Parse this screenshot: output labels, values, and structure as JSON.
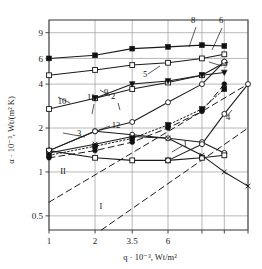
{
  "chart_data": {
    "type": "line",
    "title": "",
    "xlabel": "q · 10⁻³, Wt/m²",
    "ylabel": "α · 10⁻³, Wt/(m² K)",
    "xscale": "log",
    "yscale": "log",
    "xlim": [
      1,
      20
    ],
    "ylim": [
      0.4,
      11
    ],
    "grid": true,
    "legend_position": "inline-callouts",
    "xticks": [
      {
        "value": 1,
        "label": "1"
      },
      {
        "value": 2,
        "label": "2"
      },
      {
        "value": 3.5,
        "label": "3.5"
      },
      {
        "value": 6,
        "label": "6"
      },
      {
        "value": 10,
        "label": ""
      },
      {
        "value": 14,
        "label": ""
      },
      {
        "value": 20,
        "label": ""
      }
    ],
    "yticks": [
      {
        "value": 9,
        "label": "9"
      },
      {
        "value": 6,
        "label": "6"
      },
      {
        "value": 4,
        "label": "4"
      },
      {
        "value": 2,
        "label": "2"
      },
      {
        "value": 1,
        "label": "1"
      },
      {
        "value": 0.5,
        "label": "0.5"
      }
    ],
    "annotations": [
      {
        "text": "1",
        "x": 185,
        "y": 147
      },
      {
        "text": "2",
        "x": 113,
        "y": 99
      },
      {
        "text": "3",
        "x": 79,
        "y": 136
      },
      {
        "text": "4",
        "x": 228,
        "y": 120
      },
      {
        "text": "5",
        "x": 145,
        "y": 77
      },
      {
        "text": "6",
        "x": 221,
        "y": 23
      },
      {
        "text": "7",
        "x": 226,
        "y": 68
      },
      {
        "text": "8",
        "x": 193,
        "y": 23
      },
      {
        "text": "9",
        "x": 106,
        "y": 95
      },
      {
        "text": "10",
        "x": 62,
        "y": 104
      },
      {
        "text": "11",
        "x": 91,
        "y": 100
      },
      {
        "text": "12",
        "x": 116,
        "y": 128
      },
      {
        "text": "I",
        "x": 101,
        "y": 209
      },
      {
        "text": "II",
        "x": 63,
        "y": 174
      }
    ],
    "series": [
      {
        "name": "8",
        "marker": "filled-square",
        "style": "solid",
        "points": [
          [
            1.0,
            6.0
          ],
          [
            2.0,
            6.3
          ],
          [
            3.5,
            7.0
          ],
          [
            6.0,
            7.2
          ],
          [
            10.0,
            7.4
          ],
          [
            14.0,
            7.3
          ]
        ]
      },
      {
        "name": "6",
        "marker": "open-square",
        "style": "solid",
        "points": [
          [
            1.0,
            4.6
          ],
          [
            2.0,
            5.0
          ],
          [
            3.5,
            5.4
          ],
          [
            6.0,
            5.6
          ],
          [
            10.0,
            6.0
          ],
          [
            14.0,
            6.4
          ]
        ]
      },
      {
        "name": "9",
        "marker": "open-square",
        "style": "solid",
        "points": [
          [
            1.0,
            2.7
          ],
          [
            2.0,
            3.2
          ],
          [
            3.5,
            3.7
          ],
          [
            6.0,
            4.1
          ],
          [
            10.0,
            4.6
          ],
          [
            14.0,
            5.6
          ]
        ]
      },
      {
        "name": "5",
        "marker": "filled-triangle",
        "style": "solid",
        "points": [
          [
            2.0,
            3.2
          ],
          [
            3.5,
            4.0
          ],
          [
            6.0,
            4.2
          ],
          [
            10.0,
            4.6
          ],
          [
            14.0,
            4.8
          ]
        ]
      },
      {
        "name": "7",
        "marker": "open-circle",
        "style": "solid",
        "points": [
          [
            1.0,
            1.4
          ],
          [
            2.0,
            1.9
          ],
          [
            3.5,
            2.2
          ],
          [
            6.0,
            3.0
          ],
          [
            10.0,
            4.0
          ],
          [
            14.0,
            5.7
          ]
        ]
      },
      {
        "name": "11",
        "marker": "open-circle",
        "style": "solid",
        "points": [
          [
            1.0,
            1.4
          ],
          [
            2.0,
            1.9
          ],
          [
            3.5,
            1.8
          ],
          [
            6.0,
            1.7
          ],
          [
            10.0,
            1.6
          ],
          [
            14.0,
            1.35
          ]
        ]
      },
      {
        "name": "3",
        "marker": "open-square",
        "style": "solid",
        "points": [
          [
            1.0,
            1.4
          ],
          [
            2.0,
            1.25
          ],
          [
            3.5,
            1.2
          ],
          [
            6.0,
            1.2
          ],
          [
            10.0,
            1.25
          ],
          [
            14.0,
            1.3
          ]
        ]
      },
      {
        "name": "12",
        "marker": "filled-square",
        "style": "dotted",
        "points": [
          [
            1.0,
            1.3
          ],
          [
            2.0,
            1.5
          ],
          [
            3.5,
            1.7
          ],
          [
            6.0,
            2.1
          ],
          [
            10.0,
            2.7
          ],
          [
            14.0,
            3.7
          ]
        ]
      },
      {
        "name": "4",
        "marker": "filled-circle",
        "style": "dashed",
        "points": [
          [
            1.0,
            1.25
          ],
          [
            2.0,
            1.4
          ],
          [
            3.5,
            1.6
          ],
          [
            6.0,
            2.0
          ],
          [
            10.0,
            2.6
          ],
          [
            14.0,
            4.0
          ]
        ]
      },
      {
        "name": "1",
        "marker": "open-circle",
        "style": "solid",
        "points": [
          [
            6.0,
            1.2
          ],
          [
            10.0,
            1.55
          ],
          [
            14.0,
            2.5
          ],
          [
            20.0,
            4.0
          ]
        ]
      },
      {
        "name": "2",
        "marker": "cross",
        "style": "solid",
        "points": [
          [
            1.0,
            1.35
          ],
          [
            2.0,
            1.55
          ],
          [
            3.5,
            1.75
          ],
          [
            6.0,
            1.7
          ],
          [
            10.0,
            1.3
          ],
          [
            14.0,
            1.0
          ],
          [
            20.0,
            0.8
          ]
        ]
      },
      {
        "name": "II",
        "marker": "none",
        "style": "dashed",
        "points": [
          [
            1.0,
            0.62
          ],
          [
            20.0,
            4.0
          ]
        ]
      },
      {
        "name": "I",
        "marker": "none",
        "style": "dashed",
        "points": [
          [
            2.2,
            0.4
          ],
          [
            20.0,
            2.0
          ]
        ]
      }
    ]
  },
  "axes": {
    "xlabel": "q · 10⁻³, Wt/m²",
    "ylabel": "α · 10⁻³, Wt/(m² K)"
  },
  "colors": {
    "ink": "#1a1a1a",
    "grid": "#9a9a9a",
    "frame": "#444444",
    "background": "#ffffff"
  }
}
